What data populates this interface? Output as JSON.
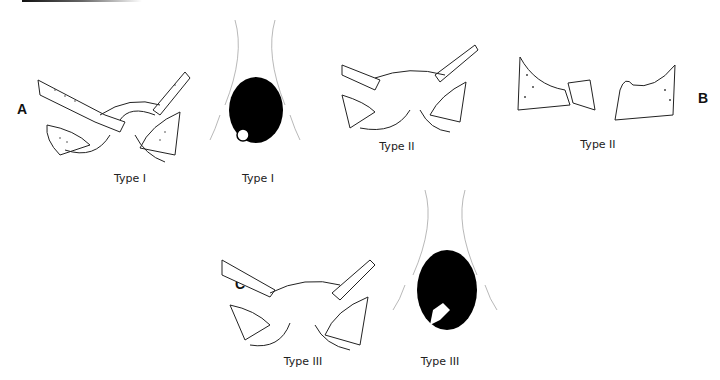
{
  "figure": {
    "panels": [
      {
        "letter": "A",
        "captions": [
          "Type I",
          "Type I"
        ]
      },
      {
        "letter": "B",
        "captions": [
          "Type II",
          "Type II"
        ]
      },
      {
        "letter": "C",
        "captions": [
          "Type III",
          "Type III"
        ]
      }
    ]
  }
}
